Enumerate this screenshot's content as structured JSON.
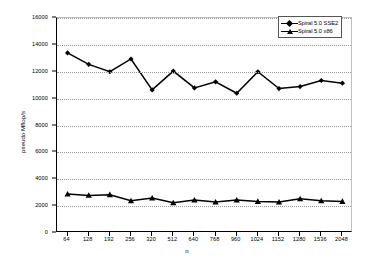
{
  "chart_data": {
    "type": "line",
    "title": "",
    "xlabel": "n",
    "ylabel": "pseudo Mflop/s",
    "grid": true,
    "legend_position": "top-right",
    "ylim": [
      0,
      16000
    ],
    "ytick_labels": [
      "0",
      "2000",
      "4000",
      "6000",
      "8000",
      "10000",
      "12000",
      "14000",
      "16000"
    ],
    "ytick_values": [
      0,
      2000,
      4000,
      6000,
      8000,
      10000,
      12000,
      14000,
      16000
    ],
    "categories": [
      "64",
      "128",
      "192",
      "256",
      "320",
      "512",
      "640",
      "768",
      "960",
      "1024",
      "1152",
      "1280",
      "1536",
      "2048"
    ],
    "series": [
      {
        "name": "Spiral 5.0 SSE2",
        "marker": "diamond",
        "color": "#000000",
        "values": [
          13400,
          12550,
          12000,
          12950,
          10650,
          12050,
          10800,
          11250,
          10400,
          12000,
          10750,
          10900,
          11350,
          11150
        ]
      },
      {
        "name": "Spiral 5.0 x86",
        "marker": "triangle",
        "color": "#000000",
        "values": [
          2900,
          2800,
          2850,
          2400,
          2600,
          2250,
          2450,
          2300,
          2450,
          2350,
          2300,
          2550,
          2400,
          2350
        ]
      }
    ]
  },
  "legend": {
    "entries": [
      {
        "label": "Spiral 5.0 SSE2",
        "marker": "diamond-marker-icon"
      },
      {
        "label": "Spiral 5.0 x86",
        "marker": "triangle-marker-icon"
      }
    ]
  },
  "axes": {
    "x_axis_title": "n",
    "y_axis_title": "pseudo Mflop/s"
  }
}
